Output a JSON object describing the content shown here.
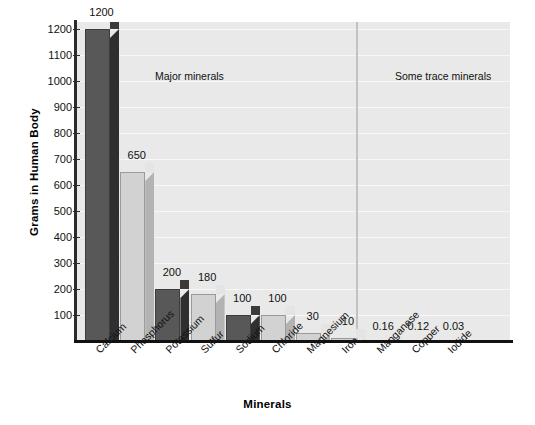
{
  "chart_data": {
    "type": "bar",
    "title": "",
    "xlabel": "Minerals",
    "ylabel": "Grams in Human Body",
    "categories": [
      "Calcium",
      "Phosphorus",
      "Potassium",
      "Sulfur",
      "Sodium",
      "Chloride",
      "Magnesium",
      "Iron",
      "Manganese",
      "Copper",
      "Iodide"
    ],
    "values": [
      1200,
      650,
      200,
      180,
      100,
      100,
      30,
      10,
      0.16,
      0.12,
      0.03
    ],
    "value_labels": [
      "1200",
      "650",
      "200",
      "180",
      "100",
      "100",
      "30",
      "10",
      "0.16",
      "0.12",
      "0.03"
    ],
    "bar_styles": [
      "dark",
      "light",
      "dark",
      "light",
      "dark",
      "light",
      "light",
      "light",
      "none",
      "none",
      "none"
    ],
    "ylim": [
      0,
      1250
    ],
    "yticks": [
      100,
      200,
      300,
      400,
      500,
      600,
      700,
      800,
      900,
      1000,
      1100,
      1200
    ],
    "ytick_labels": [
      "100",
      "200",
      "300",
      "400",
      "500",
      "600",
      "700",
      "800",
      "900",
      "1000",
      "1100",
      "1200"
    ],
    "grid": true,
    "grid_color": "#f7f7f7",
    "plot_background": "#e9e9e9",
    "bar_color_dark": "#585858",
    "bar_color_light": "#d2d2d2",
    "legend": "none",
    "annotations": [
      {
        "text": "Major minerals",
        "group": "major"
      },
      {
        "text": "Some trace minerals",
        "group": "trace"
      }
    ],
    "divider": {
      "after_category": "Magnesium",
      "color": "#c2c2c2"
    }
  },
  "sections": {
    "major": "Major minerals",
    "trace": "Some trace minerals"
  },
  "axis": {
    "y_title": "Grams in Human Body",
    "x_title": "Minerals"
  }
}
